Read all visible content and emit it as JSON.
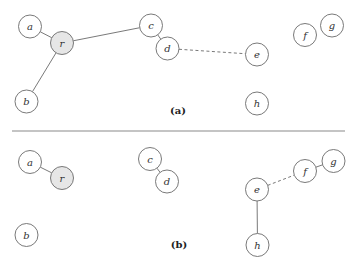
{
  "diagram": {
    "type": "graph-comparison",
    "divider": {
      "x1": 12,
      "x2": 345,
      "y": 131,
      "color": "#8a8a8a"
    },
    "node_style": {
      "radius": 11.5,
      "stroke": "#6a6a6a",
      "fill": "#ffffff",
      "root_fill": "#e6e6e6"
    },
    "panels": [
      {
        "id": "a",
        "label": "(a)",
        "label_pos": {
          "x": 178,
          "y": 110.5
        },
        "nodes": [
          {
            "id": "a",
            "label": "a",
            "x": 30,
            "y": 26.5,
            "root": false
          },
          {
            "id": "r",
            "label": "r",
            "x": 62,
            "y": 43,
            "root": true
          },
          {
            "id": "b",
            "label": "b",
            "x": 26.5,
            "y": 101.5,
            "root": false
          },
          {
            "id": "c",
            "label": "c",
            "x": 151,
            "y": 25.5,
            "root": false
          },
          {
            "id": "d",
            "label": "d",
            "x": 167.5,
            "y": 48.5,
            "root": false
          },
          {
            "id": "e",
            "label": "e",
            "x": 257,
            "y": 54.5,
            "root": false
          },
          {
            "id": "f",
            "label": "f",
            "x": 305,
            "y": 35,
            "root": false
          },
          {
            "id": "g",
            "label": "g",
            "x": 332,
            "y": 25.5,
            "root": false
          },
          {
            "id": "h",
            "label": "h",
            "x": 257,
            "y": 103.5,
            "root": false
          }
        ],
        "edges": [
          {
            "from": "a",
            "to": "r",
            "style": "solid"
          },
          {
            "from": "r",
            "to": "b",
            "style": "solid"
          },
          {
            "from": "r",
            "to": "c",
            "style": "solid"
          },
          {
            "from": "c",
            "to": "d",
            "style": "solid"
          },
          {
            "from": "d",
            "to": "e",
            "style": "dashed"
          }
        ]
      },
      {
        "id": "b",
        "label": "(b)",
        "label_pos": {
          "x": 179,
          "y": 244.5
        },
        "nodes": [
          {
            "id": "a",
            "label": "a",
            "x": 30,
            "y": 162,
            "root": false
          },
          {
            "id": "r",
            "label": "r",
            "x": 62,
            "y": 178,
            "root": true
          },
          {
            "id": "b",
            "label": "b",
            "x": 26.5,
            "y": 235,
            "root": false
          },
          {
            "id": "c",
            "label": "c",
            "x": 150,
            "y": 159,
            "root": false
          },
          {
            "id": "d",
            "label": "d",
            "x": 167,
            "y": 181.5,
            "root": false
          },
          {
            "id": "e",
            "label": "e",
            "x": 257,
            "y": 189.5,
            "root": false
          },
          {
            "id": "f",
            "label": "f",
            "x": 305,
            "y": 171,
            "root": false
          },
          {
            "id": "g",
            "label": "g",
            "x": 333.5,
            "y": 161,
            "root": false
          },
          {
            "id": "h",
            "label": "h",
            "x": 257.5,
            "y": 245,
            "root": false
          }
        ],
        "edges": [
          {
            "from": "a",
            "to": "r",
            "style": "solid"
          },
          {
            "from": "c",
            "to": "d",
            "style": "solid"
          },
          {
            "from": "e",
            "to": "f",
            "style": "dashed"
          },
          {
            "from": "f",
            "to": "g",
            "style": "solid"
          },
          {
            "from": "e",
            "to": "h",
            "style": "solid"
          }
        ]
      }
    ]
  }
}
